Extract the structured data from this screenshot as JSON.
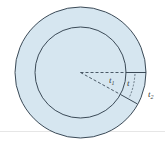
{
  "diagram": {
    "colors": {
      "fill": "#d6e6f0",
      "stroke": "#3b4a57",
      "background": "#ffffff",
      "separator": "#e6e6e6"
    },
    "labels": {
      "t1": {
        "base": "t",
        "sub": "1"
      },
      "t": {
        "base": "t"
      },
      "t2": {
        "base": "t",
        "sub": "2"
      }
    }
  }
}
